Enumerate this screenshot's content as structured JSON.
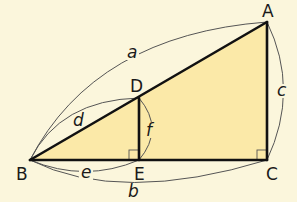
{
  "figure": {
    "type": "geometry-diagram",
    "colors": {
      "background": "#fbf6dc",
      "fill": "#fbe9a8",
      "stroke": "#111111",
      "arc": "#555555"
    },
    "points": [
      {
        "id": "A",
        "label": "A"
      },
      {
        "id": "B",
        "label": "B"
      },
      {
        "id": "C",
        "label": "C"
      },
      {
        "id": "D",
        "label": "D"
      },
      {
        "id": "E",
        "label": "E"
      }
    ],
    "segments": [
      {
        "id": "a",
        "label": "a",
        "from": "B",
        "to": "A"
      },
      {
        "id": "b",
        "label": "b",
        "from": "B",
        "to": "C"
      },
      {
        "id": "c",
        "label": "c",
        "from": "A",
        "to": "C"
      },
      {
        "id": "d",
        "label": "d",
        "from": "B",
        "to": "D"
      },
      {
        "id": "e",
        "label": "e",
        "from": "B",
        "to": "E"
      },
      {
        "id": "f",
        "label": "f",
        "from": "D",
        "to": "E"
      }
    ],
    "right_angles": [
      "C",
      "E"
    ]
  }
}
